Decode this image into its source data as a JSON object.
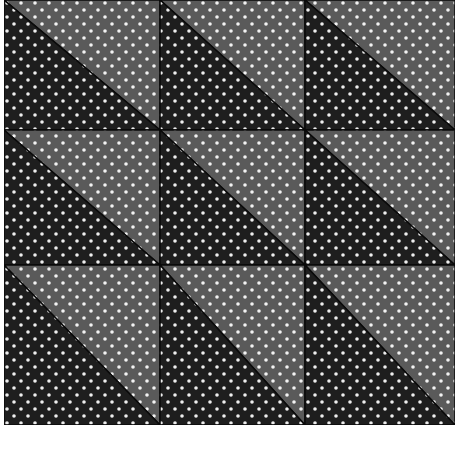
{
  "image": {
    "subject": "quilt of half-square triangle blocks in polka-dot fabric",
    "grid": {
      "rows": 3,
      "cols": 3
    },
    "colors": {
      "dark": "#1e1e1e",
      "light": "#5a5a5a",
      "dot": "#f0f0f0",
      "seam": "#0a0a0a",
      "background": "#ffffff"
    }
  }
}
